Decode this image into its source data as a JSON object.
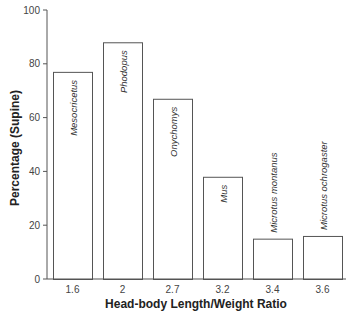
{
  "chart_data": {
    "type": "bar",
    "title": "",
    "xlabel": "Head-body Length/Weight Ratio",
    "ylabel": "Percentage (Supine)",
    "ylim": [
      0,
      100
    ],
    "yticks": [
      0,
      20,
      40,
      60,
      80,
      100
    ],
    "grid": false,
    "legend": null,
    "categories": [
      "1.6",
      "2",
      "2.7",
      "3.2",
      "3.4",
      "3.6"
    ],
    "bar_labels": [
      "Mesocricetus",
      "Phodopus",
      "Onychomys",
      "Mus",
      "Microtus montanus",
      "Microtus ochrogaster"
    ],
    "values": [
      77,
      88,
      67,
      38,
      15,
      16
    ]
  }
}
